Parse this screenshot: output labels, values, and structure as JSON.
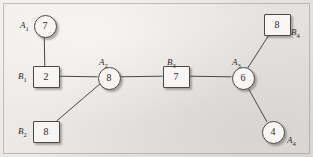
{
  "figure": {
    "background_color": "#e9e7e4",
    "line_color": "#4a4845",
    "node_fill": "#f7f6f4"
  },
  "graph_data": {
    "type": "graph",
    "description": "Bipartite-style tree with circular A nodes and square B nodes, each annotated with a numeric value",
    "nodes": [
      {
        "id": "A1",
        "shape": "circle",
        "value": "7",
        "label": "A",
        "sub": "1",
        "cx": 44,
        "cy": 25,
        "label_x": 20,
        "label_y": 21
      },
      {
        "id": "B1",
        "shape": "square",
        "value": "2",
        "label": "B",
        "sub": "1",
        "cx": 45,
        "cy": 76,
        "label_x": 18,
        "label_y": 72
      },
      {
        "id": "B2",
        "shape": "square",
        "value": "8",
        "label": "B",
        "sub": "2",
        "cx": 45,
        "cy": 131,
        "label_x": 18,
        "label_y": 127
      },
      {
        "id": "A2",
        "shape": "circle",
        "value": "8",
        "label": "A",
        "sub": "2",
        "cx": 108,
        "cy": 77,
        "label_x": 99,
        "label_y": 58
      },
      {
        "id": "B3",
        "shape": "square",
        "value": "7",
        "label": "B",
        "sub": "3",
        "cx": 175,
        "cy": 76,
        "label_x": 167,
        "label_y": 58
      },
      {
        "id": "A3",
        "shape": "circle",
        "value": "6",
        "label": "A",
        "sub": "3",
        "cx": 242,
        "cy": 77,
        "label_x": 232,
        "label_y": 58
      },
      {
        "id": "B4",
        "shape": "square",
        "value": "8",
        "label": "B",
        "sub": "4",
        "cx": 276,
        "cy": 24,
        "label_x": 291,
        "label_y": 28
      },
      {
        "id": "A4",
        "shape": "circle",
        "value": "4",
        "label": "A",
        "sub": "4",
        "cx": 272,
        "cy": 131,
        "label_x": 287,
        "label_y": 136
      }
    ],
    "edges": [
      {
        "from": "A1",
        "to": "B1"
      },
      {
        "from": "B1",
        "to": "A2"
      },
      {
        "from": "B2",
        "to": "A2"
      },
      {
        "from": "A2",
        "to": "B3"
      },
      {
        "from": "B3",
        "to": "A3"
      },
      {
        "from": "A3",
        "to": "B4"
      },
      {
        "from": "A3",
        "to": "A4"
      }
    ]
  }
}
